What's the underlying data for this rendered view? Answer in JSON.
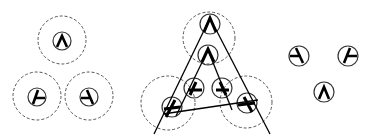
{
  "figure": {
    "panels": [
      {
        "id": "left",
        "label": "grouped detectors with dashed support regions"
      },
      {
        "id": "middle",
        "label": "detectors aligned along triangle edges"
      },
      {
        "id": "right",
        "label": "isolated junction detectors"
      }
    ]
  },
  "colors": {
    "background": "#ffffff",
    "stroke": "#000000",
    "dashed": "#555555"
  }
}
